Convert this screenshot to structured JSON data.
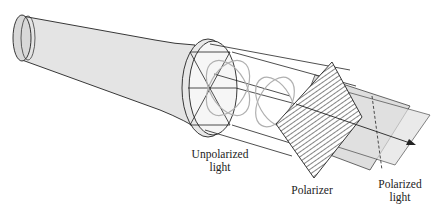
{
  "diagram": {
    "labels": {
      "unpolarized": [
        "Unpolarized",
        "light"
      ],
      "polarizer": [
        "Polarizer"
      ],
      "polarized": [
        "Polarized",
        "light"
      ]
    },
    "components": [
      "flashlight",
      "unpolarized-beam",
      "polarizer-sheet",
      "polarized-plane",
      "propagation-arrow"
    ],
    "colors": {
      "stroke": "#222222",
      "flashlight_fill": "#e4e4e4",
      "lens_fill": "#f6f6f6",
      "plane_fill": "#d9d9d9",
      "wave_stroke": "#b0b0b0"
    }
  }
}
